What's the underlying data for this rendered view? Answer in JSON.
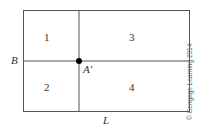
{
  "diagram": {
    "regions": [
      "1",
      "2",
      "3",
      "4"
    ],
    "axis_labels": {
      "vertical_line": "L",
      "horizontal_line": "B"
    },
    "point_label": "A′",
    "copyright": "© Cengage Learning 2014",
    "line_color": "#555555",
    "dot_color": "#000000"
  }
}
